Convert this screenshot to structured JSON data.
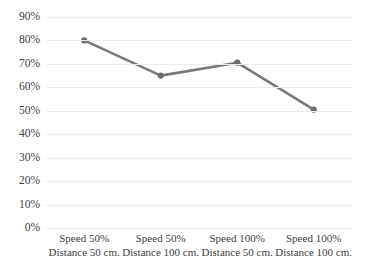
{
  "chart_data": {
    "type": "line",
    "title": "",
    "subtitle": "",
    "xlabel": "",
    "ylabel": "",
    "categories": [
      "Speed 50% Distance 50 cm.",
      "Speed 50% Distance 100 cm.",
      "Speed 100% Distance 50 cm.",
      "Speed 100% Distance 100 cm."
    ],
    "category_lines": [
      {
        "line1": "Speed 50%",
        "line2": "Distance 50 cm."
      },
      {
        "line1": "Speed 50%",
        "line2": "Distance 100 cm."
      },
      {
        "line1": "Speed 100%",
        "line2": "Distance 50 cm."
      },
      {
        "line1": "Speed 100%",
        "line2": "Distance 100 cm."
      }
    ],
    "values": [
      80,
      65,
      70.5,
      50.5
    ],
    "series": [
      {
        "name": "",
        "values": [
          80,
          65,
          70.5,
          50.5
        ]
      }
    ],
    "ylim": [
      0,
      90
    ],
    "ytick_step": 10,
    "ytick_labels": [
      "0%",
      "10%",
      "20%",
      "30%",
      "40%",
      "50%",
      "60%",
      "70%",
      "80%",
      "90%"
    ],
    "ytick_values": [
      0,
      10,
      20,
      30,
      40,
      50,
      60,
      70,
      80,
      90
    ],
    "grid": "horizontal",
    "legend": "none",
    "value_format": "percent",
    "marker": "circle"
  },
  "style": {
    "line_color": "#7a7a7a",
    "marker_color": "#6e6e6e",
    "gridline_color": "#ececed",
    "background_color": "#ffffff",
    "tick_label_color": "#404040"
  }
}
